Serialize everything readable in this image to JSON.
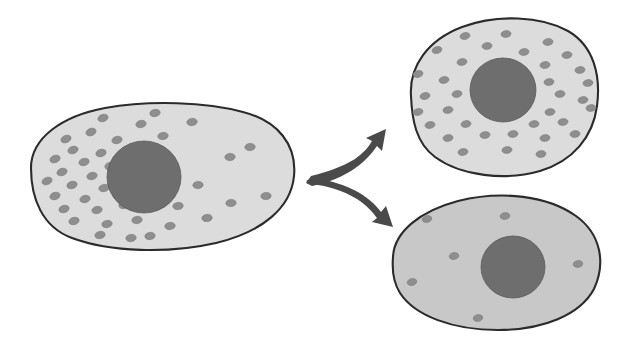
{
  "figure": {
    "background_color": "#ffffff",
    "width": 629,
    "height": 348
  },
  "palette": {
    "background": "#ffffff",
    "membrane_stroke": "#2b2b2b",
    "cytoplasm_light": "#dcdcdc",
    "cytoplasm_dark": "#c8c8c8",
    "nucleus_fill": "#6e6e6e",
    "nucleus_stroke": "#5a5a5a",
    "granule_fill": "#8e8e8e",
    "granule_stroke": "#7a7a7a",
    "arrow_fill": "#4a4a4a"
  },
  "cells": [
    {
      "id": "parent-cell",
      "name": "parent-cell",
      "label": "Parent cell",
      "cytoplasm_color": "#dcdcdc",
      "membrane_width": 2.1,
      "outline_path": "M 31 168 C 31 138, 62 116, 105 108 C 150 100, 206 102, 243 112 C 278 121, 297 145, 294 176 C 291 208, 262 232, 216 243 C 168 254, 110 252, 72 238 C 42 227, 31 198, 31 168 Z",
      "nucleus": {
        "cx": 144,
        "cy": 177,
        "rx": 37,
        "ry": 36,
        "fill": "#6e6e6e"
      },
      "granule_count": 39,
      "granule_rx": 5.2,
      "granule_ry": 3.6,
      "granules": [
        {
          "cx": 103,
          "cy": 118,
          "rot": -18
        },
        {
          "cx": 141,
          "cy": 124,
          "rot": -12
        },
        {
          "cx": 91,
          "cy": 132,
          "rot": -20
        },
        {
          "cx": 66,
          "cy": 139,
          "rot": -22
        },
        {
          "cx": 117,
          "cy": 140,
          "rot": -14
        },
        {
          "cx": 155,
          "cy": 113,
          "rot": -10
        },
        {
          "cx": 73,
          "cy": 150,
          "rot": -18
        },
        {
          "cx": 101,
          "cy": 153,
          "rot": -16
        },
        {
          "cx": 132,
          "cy": 148,
          "rot": -12
        },
        {
          "cx": 55,
          "cy": 159,
          "rot": -20
        },
        {
          "cx": 84,
          "cy": 162,
          "rot": -15
        },
        {
          "cx": 110,
          "cy": 166,
          "rot": -13
        },
        {
          "cx": 62,
          "cy": 172,
          "rot": -19
        },
        {
          "cx": 92,
          "cy": 176,
          "rot": -14
        },
        {
          "cx": 47,
          "cy": 181,
          "rot": -21
        },
        {
          "cx": 72,
          "cy": 185,
          "rot": -16
        },
        {
          "cx": 104,
          "cy": 188,
          "rot": -11
        },
        {
          "cx": 55,
          "cy": 196,
          "rot": -18
        },
        {
          "cx": 85,
          "cy": 199,
          "rot": -14
        },
        {
          "cx": 64,
          "cy": 209,
          "rot": -16
        },
        {
          "cx": 97,
          "cy": 210,
          "rot": -12
        },
        {
          "cx": 124,
          "cy": 205,
          "rot": -10
        },
        {
          "cx": 74,
          "cy": 221,
          "rot": -15
        },
        {
          "cx": 107,
          "cy": 224,
          "rot": -11
        },
        {
          "cx": 137,
          "cy": 220,
          "rot": -9
        },
        {
          "cx": 100,
          "cy": 235,
          "rot": -12
        },
        {
          "cx": 131,
          "cy": 238,
          "rot": -8
        },
        {
          "cx": 122,
          "cy": 178,
          "rot": -12
        },
        {
          "cx": 163,
          "cy": 136,
          "rot": -9
        },
        {
          "cx": 192,
          "cy": 122,
          "rot": -7
        },
        {
          "cx": 150,
          "cy": 236,
          "rot": -8
        },
        {
          "cx": 170,
          "cy": 226,
          "rot": -7
        },
        {
          "cx": 178,
          "cy": 206,
          "rot": -6
        },
        {
          "cx": 198,
          "cy": 185,
          "rot": -5
        },
        {
          "cx": 207,
          "cy": 218,
          "rot": -6
        },
        {
          "cx": 230,
          "cy": 157,
          "rot": -5
        },
        {
          "cx": 231,
          "cy": 203,
          "rot": -5
        },
        {
          "cx": 266,
          "cy": 196,
          "rot": -4
        },
        {
          "cx": 250,
          "cy": 147,
          "rot": -5
        }
      ]
    },
    {
      "id": "daughter-cell-top",
      "name": "daughter-cell-granule-rich",
      "label": "Granule-rich daughter cell",
      "cytoplasm_color": "#dcdcdc",
      "membrane_width": 2.1,
      "outline_path": "M 411 96 C 409 66, 428 40, 462 27 C 497 14, 541 16, 568 31 C 594 46, 601 76, 597 106 C 593 137, 573 161, 540 171 C 505 181, 461 176, 435 157 C 416 143, 412 120, 411 96 Z",
      "nucleus": {
        "cx": 503,
        "cy": 90,
        "rx": 33,
        "ry": 32,
        "fill": "#6e6e6e"
      },
      "granule_count": 34,
      "granule_rx": 5.0,
      "granule_ry": 3.4,
      "granules": [
        {
          "cx": 465,
          "cy": 36,
          "rot": -12
        },
        {
          "cx": 506,
          "cy": 34,
          "rot": -8
        },
        {
          "cx": 548,
          "cy": 42,
          "rot": -8
        },
        {
          "cx": 437,
          "cy": 50,
          "rot": -14
        },
        {
          "cx": 487,
          "cy": 46,
          "rot": -8
        },
        {
          "cx": 524,
          "cy": 52,
          "rot": -8
        },
        {
          "cx": 567,
          "cy": 55,
          "rot": -8
        },
        {
          "cx": 462,
          "cy": 62,
          "rot": -10
        },
        {
          "cx": 545,
          "cy": 65,
          "rot": -8
        },
        {
          "cx": 580,
          "cy": 70,
          "rot": -8
        },
        {
          "cx": 418,
          "cy": 74,
          "rot": -14
        },
        {
          "cx": 444,
          "cy": 80,
          "rot": -10
        },
        {
          "cx": 549,
          "cy": 82,
          "rot": -8
        },
        {
          "cx": 588,
          "cy": 83,
          "rot": -8
        },
        {
          "cx": 425,
          "cy": 96,
          "rot": -12
        },
        {
          "cx": 457,
          "cy": 94,
          "rot": -10
        },
        {
          "cx": 560,
          "cy": 94,
          "rot": -8
        },
        {
          "cx": 583,
          "cy": 100,
          "rot": -8
        },
        {
          "cx": 418,
          "cy": 112,
          "rot": -12
        },
        {
          "cx": 448,
          "cy": 110,
          "rot": -10
        },
        {
          "cx": 550,
          "cy": 112,
          "rot": -8
        },
        {
          "cx": 591,
          "cy": 108,
          "rot": -8
        },
        {
          "cx": 430,
          "cy": 125,
          "rot": -10
        },
        {
          "cx": 466,
          "cy": 124,
          "rot": -9
        },
        {
          "cx": 534,
          "cy": 124,
          "rot": -8
        },
        {
          "cx": 563,
          "cy": 122,
          "rot": -8
        },
        {
          "cx": 448,
          "cy": 138,
          "rot": -9
        },
        {
          "cx": 485,
          "cy": 135,
          "rot": -8
        },
        {
          "cx": 513,
          "cy": 134,
          "rot": -8
        },
        {
          "cx": 545,
          "cy": 138,
          "rot": -8
        },
        {
          "cx": 575,
          "cy": 134,
          "rot": -8
        },
        {
          "cx": 463,
          "cy": 152,
          "rot": -9
        },
        {
          "cx": 507,
          "cy": 150,
          "rot": -8
        },
        {
          "cx": 541,
          "cy": 154,
          "rot": -8
        }
      ]
    },
    {
      "id": "daughter-cell-bottom",
      "name": "daughter-cell-granule-poor",
      "label": "Granule-poor daughter cell",
      "cytoplasm_color": "#c8c8c8",
      "membrane_width": 2.1,
      "outline_path": "M 393 257 C 394 232, 420 211, 458 201 C 502 190, 548 196, 576 216 C 601 234, 606 263, 594 289 C 580 315, 543 330, 498 330 C 453 330, 415 316, 400 293 C 393 282, 392 269, 393 257 Z",
      "nucleus": {
        "cx": 513,
        "cy": 267,
        "rx": 32,
        "ry": 31,
        "fill": "#6e6e6e"
      },
      "granule_count": 6,
      "granule_rx": 4.8,
      "granule_ry": 3.4,
      "granules": [
        {
          "cx": 427,
          "cy": 219,
          "rot": -12
        },
        {
          "cx": 505,
          "cy": 216,
          "rot": -8
        },
        {
          "cx": 454,
          "cy": 256,
          "rot": -10
        },
        {
          "cx": 412,
          "cy": 282,
          "rot": -12
        },
        {
          "cx": 578,
          "cy": 264,
          "rot": -8
        },
        {
          "cx": 478,
          "cy": 318,
          "rot": -9
        }
      ]
    }
  ],
  "arrows": {
    "name": "branching-arrows",
    "label": "Differentiation branch arrows",
    "fill_color": "#4a4a4a",
    "origin": {
      "x": 312,
      "y": 180
    },
    "branches": [
      {
        "id": "arrow-up",
        "name": "arrow-to-granule-rich-cell",
        "label": "Arrow to granule-rich daughter cell",
        "direction": "up-right",
        "path": "M 311 176 C 327 172, 342 167, 355 159 C 363 153, 368 148, 372 141 L 366 138 L 386 129 L 382 151 L 377 146 C 371 155, 362 164, 351 171 C 338 179, 323 184, 312 186 L 306 183 Z"
      },
      {
        "id": "arrow-down",
        "name": "arrow-to-granule-poor-cell",
        "label": "Arrow to granule-poor daughter cell",
        "direction": "down-right",
        "path": "M 312 184 C 328 186, 344 191, 357 199 C 366 205, 372 211, 377 218 L 372 222 L 393 227 L 386 206 L 381 212 C 375 204, 366 196, 354 190 C 340 183, 324 179, 312 178 L 306 181 Z"
      }
    ]
  }
}
